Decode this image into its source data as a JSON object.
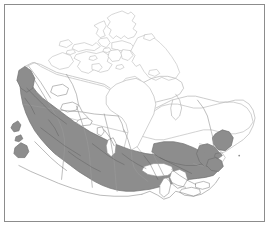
{
  "figure": {
    "kind": "thematic-map",
    "width": 270,
    "height": 228,
    "background_color": "#ffffff",
    "has_title": false,
    "has_legend": false,
    "has_axis_labels": false,
    "has_text_labels": false,
    "caption": ""
  },
  "frame": {
    "name": "map-border",
    "stroke_color": "#8c8c8c",
    "stroke_width": 1,
    "inset": 4
  },
  "map": {
    "projection_note": "conic, Canada full-country extent",
    "land_fill": "#ffffff",
    "coast_stroke": "#b9b9b9",
    "coast_stroke_width": 0.6,
    "province_stroke": "#9a9a9a",
    "province_stroke_width": 0.6,
    "water_fill": "#ffffff",
    "shaded_region": {
      "label": "shaded southern band",
      "fill": "#8d8d8d",
      "stroke": "#6f6f6f",
      "stroke_width": 0.7,
      "internal_line_stroke": "#5e5e5e",
      "coverage": "continuous band along the southern portion of the country from the Pacific coast east to the Atlantic provinces"
    },
    "unshaded_region": {
      "label": "unshaded northern region",
      "fill": "#ffffff",
      "coverage": "territories, Arctic archipelago, Hudson Bay margin and northern Quebec / Labrador"
    }
  },
  "features": {
    "water_bodies": [
      {
        "name": "hudson-bay",
        "fill": "#ffffff",
        "shaded": false
      },
      {
        "name": "james-bay",
        "fill": "#ffffff",
        "shaded": false
      },
      {
        "name": "great-lakes",
        "fill": "#ffffff",
        "shaded": false
      },
      {
        "name": "lake-winnipeg",
        "fill": "#ffffff",
        "shaded": false
      },
      {
        "name": "great-bear-lake",
        "fill": "#ffffff",
        "shaded": false
      },
      {
        "name": "great-slave-lake",
        "fill": "#ffffff",
        "shaded": false
      },
      {
        "name": "gulf-of-st-lawrence",
        "fill": "#ffffff",
        "shaded": false
      }
    ],
    "islands": [
      {
        "name": "baffin-island",
        "shaded": false
      },
      {
        "name": "victoria-island",
        "shaded": false
      },
      {
        "name": "ellesmere-island",
        "shaded": false
      },
      {
        "name": "banks-island",
        "shaded": false
      },
      {
        "name": "devon-island",
        "shaded": false
      },
      {
        "name": "melville-island",
        "shaded": false
      },
      {
        "name": "southampton-island",
        "shaded": false
      },
      {
        "name": "newfoundland",
        "shaded": true
      },
      {
        "name": "vancouver-island",
        "shaded": true
      },
      {
        "name": "prince-edward-island",
        "shaded": true
      },
      {
        "name": "anticosti-island",
        "shaded": false
      }
    ],
    "regions": [
      {
        "name": "british-columbia",
        "shaded": true
      },
      {
        "name": "yukon",
        "shaded": true
      },
      {
        "name": "northwest-territories",
        "shaded": false
      },
      {
        "name": "nunavut",
        "shaded": false
      },
      {
        "name": "alberta",
        "shaded": true
      },
      {
        "name": "saskatchewan",
        "shaded": true
      },
      {
        "name": "manitoba",
        "shaded": true
      },
      {
        "name": "ontario",
        "shaded": true
      },
      {
        "name": "quebec",
        "shaded": true
      },
      {
        "name": "new-brunswick",
        "shaded": true
      },
      {
        "name": "nova-scotia",
        "shaded": true
      },
      {
        "name": "labrador",
        "shaded": false
      }
    ]
  }
}
